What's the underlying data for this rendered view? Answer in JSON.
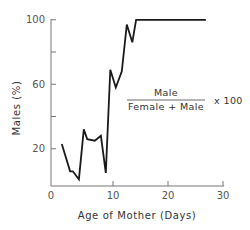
{
  "chart_data": {
    "type": "line",
    "title": "",
    "xlabel": "Age of Mother (Days)",
    "ylabel": "Males (%)",
    "xlim": [
      0,
      30
    ],
    "ylim": [
      0,
      100
    ],
    "x_ticks": [
      0,
      10,
      20,
      30
    ],
    "x_tick_labels": [
      "0",
      "10",
      "20",
      "30"
    ],
    "y_ticks": [
      20,
      40,
      60,
      80,
      100
    ],
    "y_tick_labels": [
      "20",
      "",
      "60",
      "",
      "100"
    ],
    "grid": false,
    "legend": null,
    "annotation": {
      "numerator": "Male",
      "denominator": "Female + Male",
      "multiplier": "x 100"
    },
    "series": [
      {
        "name": "Males (%)",
        "x": [
          0.7,
          2.2,
          2.7,
          3.8,
          4.7,
          5.3,
          6.7,
          7.8,
          8.7,
          9.5,
          10.5,
          11.6,
          12.5,
          13.5,
          14.2,
          26.9
        ],
        "y": [
          23,
          6,
          6,
          1,
          32,
          26,
          25,
          28,
          5,
          69,
          58,
          68,
          97,
          86,
          100,
          100
        ]
      }
    ]
  }
}
